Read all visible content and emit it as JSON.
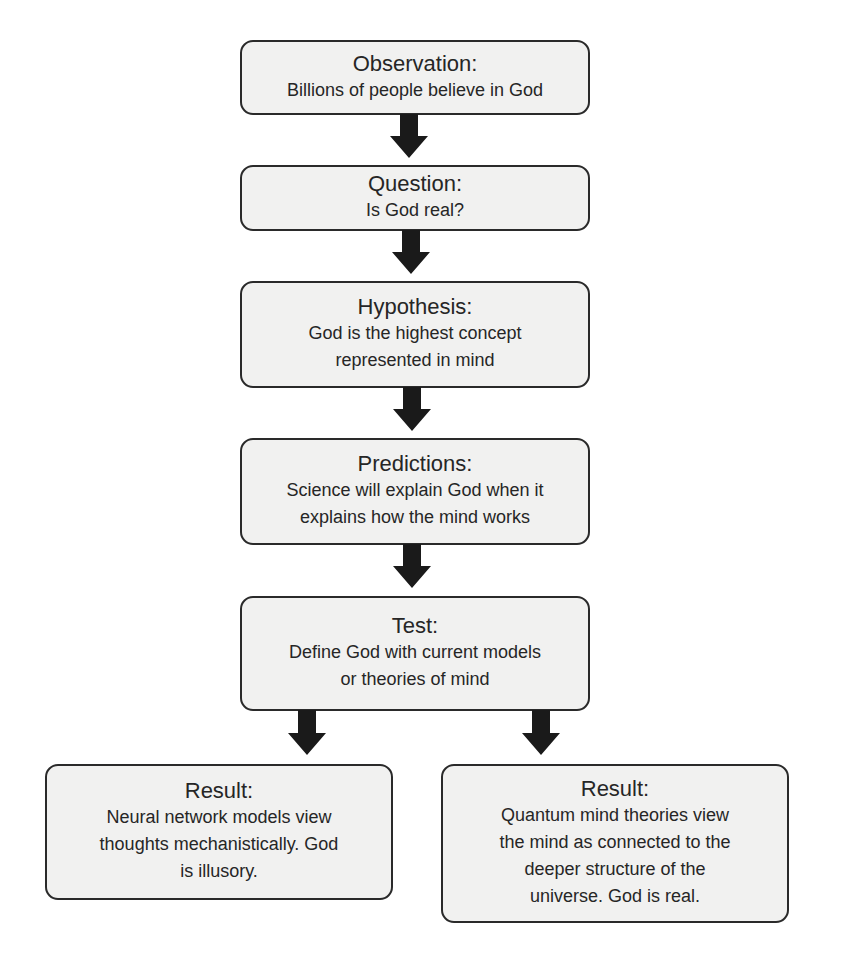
{
  "diagram": {
    "type": "flowchart",
    "colors": {
      "box_fill": "#f1f1f0",
      "box_border": "#2a2a2a",
      "arrow": "#1a1a1a",
      "text": "#262626",
      "background": "#ffffff"
    },
    "nodes": [
      {
        "id": "observation",
        "title": "Observation:",
        "body": "Billions of people believe in God"
      },
      {
        "id": "question",
        "title": "Question:",
        "body": "Is God real?"
      },
      {
        "id": "hypothesis",
        "title": "Hypothesis:",
        "body": "God is the highest concept\nrepresented in mind"
      },
      {
        "id": "predictions",
        "title": "Predictions:",
        "body": "Science will explain God when it\nexplains how the mind works"
      },
      {
        "id": "test",
        "title": "Test:",
        "body": "Define God with current models\nor theories of mind"
      },
      {
        "id": "result-left",
        "title": "Result:",
        "body": "Neural network models view\nthoughts mechanistically. God\nis illusory."
      },
      {
        "id": "result-right",
        "title": "Result:",
        "body": "Quantum mind theories view\nthe mind as connected to the\ndeeper structure of the\nuniverse. God is real."
      }
    ],
    "edges": [
      {
        "from": "observation",
        "to": "question"
      },
      {
        "from": "question",
        "to": "hypothesis"
      },
      {
        "from": "hypothesis",
        "to": "predictions"
      },
      {
        "from": "predictions",
        "to": "test"
      },
      {
        "from": "test",
        "to": "result-left"
      },
      {
        "from": "test",
        "to": "result-right"
      }
    ]
  }
}
